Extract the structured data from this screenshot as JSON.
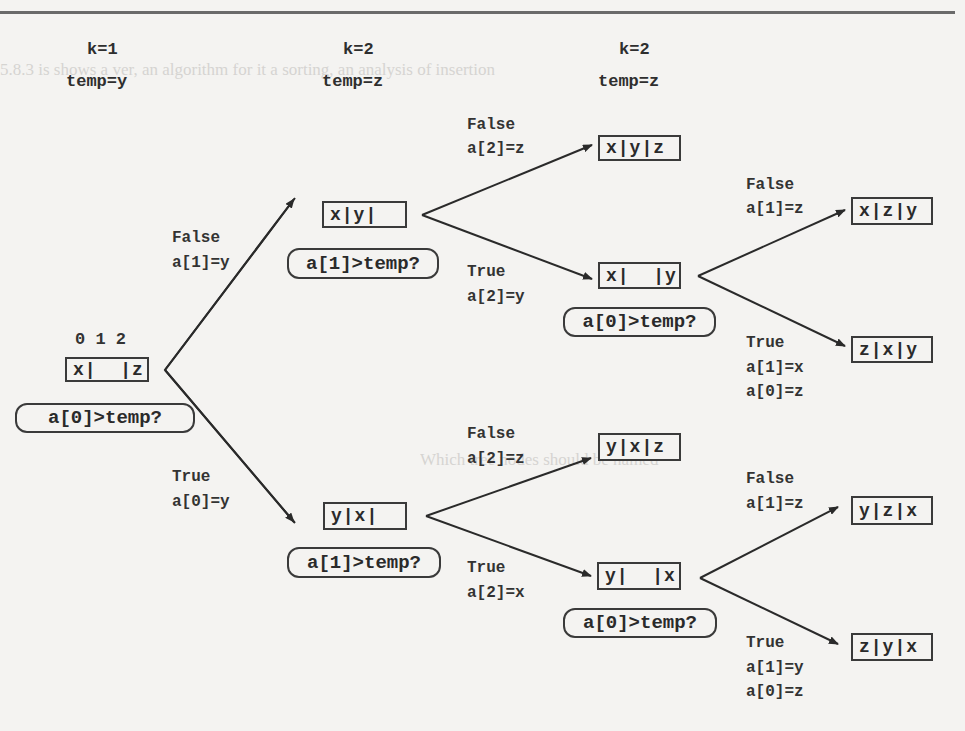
{
  "headers": [
    {
      "k": "k=1",
      "temp": "temp=y"
    },
    {
      "k": "k=2",
      "temp": "temp=z"
    },
    {
      "k": "k=2",
      "temp": "temp=z"
    }
  ],
  "root": {
    "indices": "0 1 2",
    "array": "x|  |z",
    "decision": "a[0]>temp?"
  },
  "level1": [
    {
      "branch": "False",
      "assign": "a[1]=y",
      "array": "x|y|",
      "decision": "a[1]>temp?"
    },
    {
      "branch": "True",
      "assign": "a[0]=y",
      "array": "y|x|",
      "decision": "a[1]>temp?"
    }
  ],
  "level2": [
    {
      "branch": "False",
      "assign": "a[2]=z",
      "array": "x|y|z"
    },
    {
      "branch": "True",
      "assign": "a[2]=y",
      "array": "x|  |y",
      "decision": "a[0]>temp?"
    },
    {
      "branch": "False",
      "assign": "a[2]=z",
      "array": "y|x|z"
    },
    {
      "branch": "True",
      "assign": "a[2]=x",
      "array": "y|  |x",
      "decision": "a[0]>temp?"
    }
  ],
  "level3": [
    {
      "branch": "False",
      "assign": "a[1]=z",
      "assign2": "",
      "array": "x|z|y"
    },
    {
      "branch": "True",
      "assign": "a[1]=x",
      "assign2": "a[0]=z",
      "array": "z|x|y"
    },
    {
      "branch": "False",
      "assign": "a[1]=z",
      "assign2": "",
      "array": "y|z|x"
    },
    {
      "branch": "True",
      "assign": "a[1]=y",
      "assign2": "a[0]=z",
      "array": "z|y|x"
    }
  ],
  "colors": {
    "ink": "#2a2a2a",
    "paper": "#f4f3f1",
    "rule": "#6a6a6a"
  }
}
